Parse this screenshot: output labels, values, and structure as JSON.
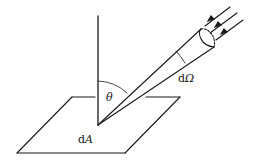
{
  "diagram": {
    "labels": {
      "theta": "θ",
      "solid_angle_d": "d",
      "solid_angle_symbol": "Ω",
      "area_d": "d",
      "area_symbol": "A"
    },
    "colors": {
      "line": "#1a1a1a",
      "background": "#ffffff"
    },
    "elements": [
      "surface-element-parallelogram",
      "surface-normal-line",
      "solid-angle-cone",
      "incident-ray-arrows"
    ]
  }
}
